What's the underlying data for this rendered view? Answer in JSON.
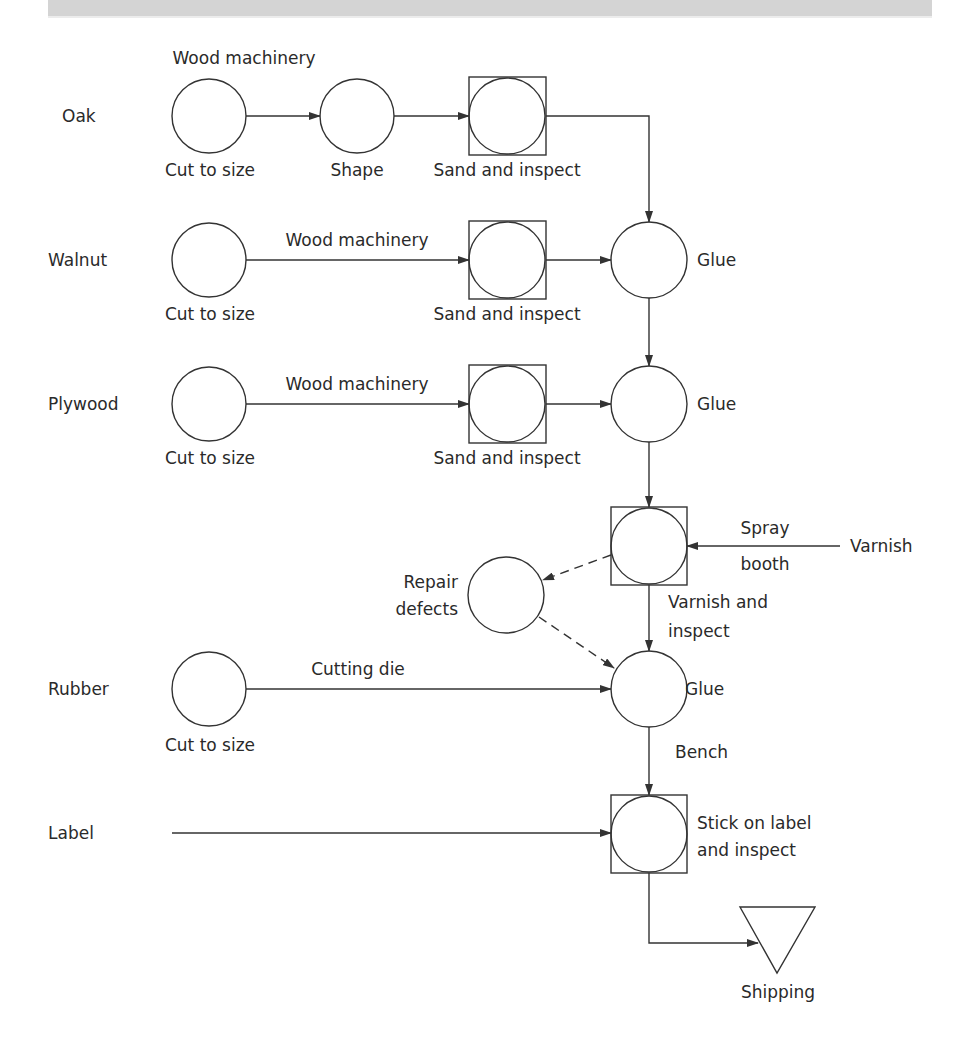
{
  "diagram": {
    "type": "process-flow-chart",
    "header_band_color": "#d4d4d4",
    "inputs": {
      "oak": "Oak",
      "walnut": "Walnut",
      "plywood": "Plywood",
      "rubber": "Rubber",
      "label": "Label",
      "varnish": "Varnish"
    },
    "oak_row": {
      "step1": "Cut to size",
      "machine": "Wood machinery",
      "step2": "Shape",
      "step3": "Sand and inspect"
    },
    "walnut_row": {
      "step1": "Cut to size",
      "machine": "Wood machinery",
      "step2": "Sand and inspect",
      "glue": "Glue"
    },
    "plywood_row": {
      "step1": "Cut to size",
      "machine": "Wood machinery",
      "step2": "Sand and inspect",
      "glue": "Glue"
    },
    "varnish_stage": {
      "spray_line1": "Spray",
      "spray_line2": "booth",
      "op_line1": "Varnish and",
      "op_line2": "inspect",
      "repair_line1": "Repair",
      "repair_line2": "defects"
    },
    "rubber_row": {
      "machine": "Cutting die",
      "step1": "Cut to size",
      "glue": "Glue",
      "bench": "Bench"
    },
    "label_row": {
      "op_line1": "Stick on label",
      "op_line2": "and inspect"
    },
    "shipping": "Shipping",
    "legend": {
      "circle": "operation",
      "circle_in_square": "operation and inspection",
      "triangle": "storage",
      "dashed_arrow": "rework path"
    }
  }
}
